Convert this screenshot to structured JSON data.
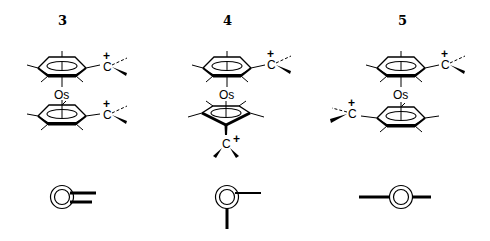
{
  "figure": {
    "compounds": [
      {
        "label": "3",
        "metal": "Os",
        "cation_label": "C",
        "charge": "+",
        "description": "Both carbocation substituents eclipsed on same side (syn)",
        "schematic": "eclipsed-syn"
      },
      {
        "label": "4",
        "metal": "Os",
        "cation_label": "C",
        "charge": "+",
        "description": "Carbocation substituents at 90 degrees",
        "schematic": "gauche-90"
      },
      {
        "label": "5",
        "metal": "Os",
        "cation_label": "C",
        "charge": "+",
        "description": "Carbocation substituents anti (180 degrees)",
        "schematic": "anti-180"
      }
    ]
  }
}
